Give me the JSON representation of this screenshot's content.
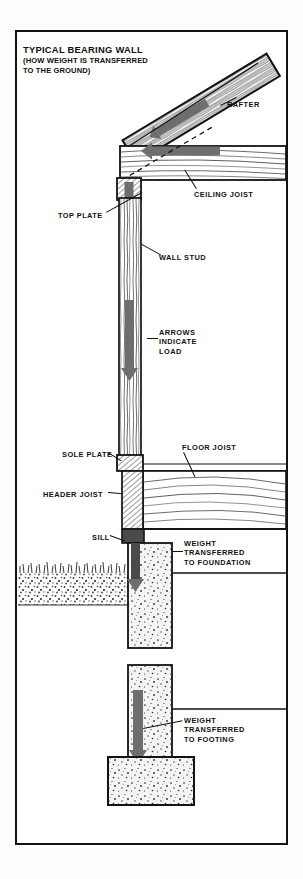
{
  "sheet": {
    "title_main": "TYPICAL BEARING WALL",
    "title_sub_line1": "(HOW WEIGHT IS TRANSFERRED",
    "title_sub_line2": "TO THE GROUND)"
  },
  "labels": {
    "rafter": "RAFTER",
    "ceiling_joist": "CEILING JOIST",
    "top_plate": "TOP PLATE",
    "wall_stud": "WALL STUD",
    "arrows_indicate_load": "ARROWS\nINDICATE\nLOAD",
    "sole_plate": "SOLE PLATE",
    "floor_joist": "FLOOR JOIST",
    "header_joist": "HEADER JOIST",
    "sill": "SILL",
    "weight_to_foundation": "WEIGHT\nTRANSFERRED\nTO FOUNDATION",
    "weight_to_footing": "WEIGHT\nTRANSFERRED\nTO FOOTING"
  },
  "colors": {
    "ink": "#131313",
    "paper": "#ffffff",
    "arrow_fill": "#6e6e6e",
    "arrow_dark": "#4a4a4a",
    "concrete": "#f2f2f2",
    "soil": "#8a8a8a"
  },
  "components": [
    {
      "name": "rafter",
      "kind": "lumber-diagonal",
      "grain": "diagonal"
    },
    {
      "name": "ceiling-joist",
      "kind": "lumber-horizontal",
      "grain": "wavy"
    },
    {
      "name": "top-plate",
      "kind": "lumber-horizontal",
      "grain": "straight"
    },
    {
      "name": "wall-stud",
      "kind": "lumber-vertical",
      "grain": "vertical"
    },
    {
      "name": "sole-plate",
      "kind": "lumber-horizontal",
      "grain": "end-hatch"
    },
    {
      "name": "floor-joist",
      "kind": "lumber-horizontal",
      "grain": "wavy"
    },
    {
      "name": "header-joist",
      "kind": "lumber-vertical",
      "grain": "end-hatch"
    },
    {
      "name": "sill",
      "kind": "lumber-small",
      "grain": "end-hatch"
    },
    {
      "name": "foundation-wall",
      "kind": "concrete",
      "grain": "speckle"
    },
    {
      "name": "footing",
      "kind": "concrete",
      "grain": "speckle"
    },
    {
      "name": "ground",
      "kind": "soil",
      "grain": "grass"
    }
  ],
  "load_arrows": [
    {
      "name": "rafter-load-arrow",
      "direction": "down-slope"
    },
    {
      "name": "ceiling-load-arrow",
      "direction": "left"
    },
    {
      "name": "stud-load-arrow-upper",
      "direction": "down"
    },
    {
      "name": "stud-load-arrow-mid",
      "direction": "down"
    },
    {
      "name": "sill-load-arrow",
      "direction": "down"
    },
    {
      "name": "foundation-load-arrow",
      "direction": "down"
    },
    {
      "name": "footing-load-arrow",
      "direction": "down"
    }
  ]
}
